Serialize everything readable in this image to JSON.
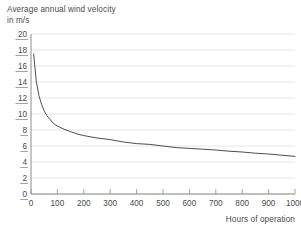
{
  "chart_data": {
    "type": "line",
    "title": "Average annual wind velocity in m/s",
    "title_lines": [
      "Average annual wind velocity",
      "in m/s"
    ],
    "xlabel": "Hours of operation",
    "ylabel": "Average annual wind velocity in m/s",
    "xlim": [
      0,
      1000
    ],
    "ylim": [
      0,
      20
    ],
    "xticks": [
      0,
      100,
      200,
      300,
      400,
      500,
      600,
      700,
      800,
      900,
      1000
    ],
    "yticks": [
      0,
      2,
      4,
      6,
      8,
      10,
      12,
      14,
      16,
      18,
      20
    ],
    "xtick_labels": [
      "0",
      "100",
      "200",
      "300",
      "400",
      "500",
      "600",
      "700",
      "800",
      "900",
      "1000"
    ],
    "ytick_labels": [
      "0",
      "2",
      "4",
      "6",
      "8",
      "10",
      "12",
      "14",
      "16",
      "18",
      "20"
    ],
    "grid": true,
    "grid_axis": "y",
    "legend": false,
    "series": [
      {
        "name": "Average annual wind velocity",
        "x": [
          10,
          20,
          30,
          40,
          50,
          60,
          70,
          80,
          90,
          100,
          125,
          150,
          175,
          200,
          250,
          300,
          350,
          400,
          450,
          500,
          550,
          600,
          650,
          700,
          750,
          800,
          850,
          900,
          950,
          1000
        ],
        "y": [
          17.5,
          14.1,
          12.3,
          11.2,
          10.4,
          9.8,
          9.4,
          9.0,
          8.7,
          8.5,
          8.1,
          7.8,
          7.5,
          7.3,
          7.0,
          6.8,
          6.5,
          6.3,
          6.2,
          6.0,
          5.8,
          5.7,
          5.6,
          5.5,
          5.35,
          5.25,
          5.1,
          5.0,
          4.85,
          4.7
        ]
      }
    ],
    "colors": {
      "line": "#4d4d4d",
      "grid": "#e6e6e6",
      "axis": "#8c8c8c",
      "text": "#4a4a4a",
      "background": "#ffffff"
    }
  }
}
